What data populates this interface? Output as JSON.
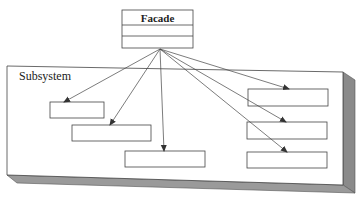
{
  "diagram": {
    "type": "uml-facade-pattern",
    "facade": {
      "label": "Facade",
      "compartments": 3
    },
    "subsystem": {
      "label": "Subsystem",
      "class_count": 6
    },
    "colors": {
      "line": "#444444",
      "box_fill": "#ffffff",
      "shade_side": "#8a8a8a",
      "shade_bottom": "#9a9a9a"
    }
  }
}
